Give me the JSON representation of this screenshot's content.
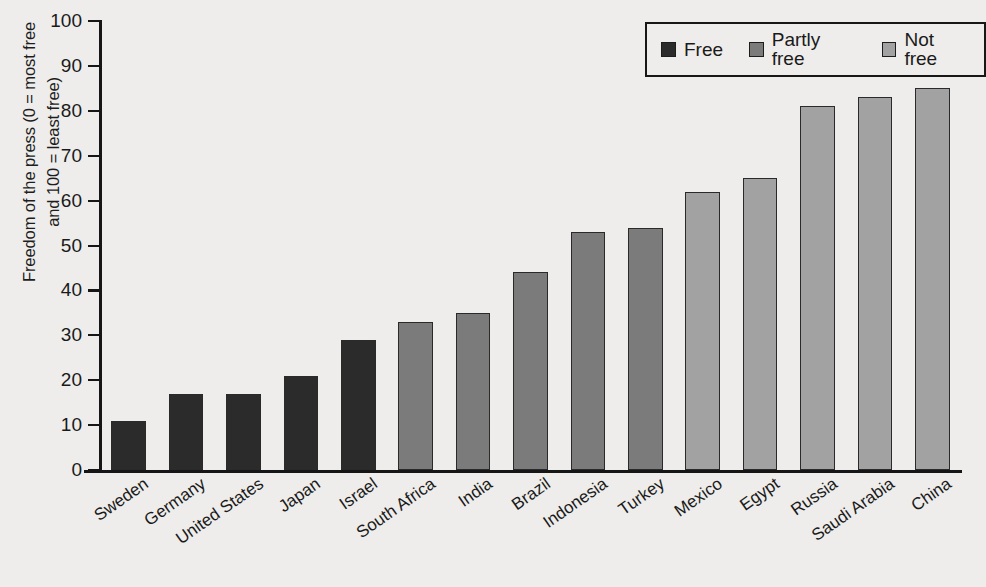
{
  "chart_data": {
    "type": "bar",
    "title": "",
    "subtitle": "",
    "xlabel": "",
    "ylabel": "Freedom of the press (0 = most free\nand 100 = least free)",
    "ylim": [
      0,
      100
    ],
    "ytick_step": 10,
    "yticks": [
      "100",
      "90",
      "80",
      "70",
      "60",
      "50",
      "40",
      "30",
      "20",
      "10",
      "0"
    ],
    "grid": false,
    "legend_position": "top-right",
    "categories": [
      "Sweden",
      "Germany",
      "United States",
      "Japan",
      "Israel",
      "South Africa",
      "India",
      "Brazil",
      "Indonesia",
      "Turkey",
      "Mexico",
      "Egypt",
      "Russia",
      "Saudi Arabia",
      "China"
    ],
    "values": [
      11,
      17,
      17,
      21,
      29,
      33,
      35,
      44,
      53,
      54,
      62,
      65,
      81,
      83,
      85
    ],
    "series": [
      {
        "name": "Freedom of the press score",
        "values": [
          11,
          17,
          17,
          21,
          29,
          33,
          35,
          44,
          53,
          54,
          62,
          65,
          81,
          83,
          85
        ]
      }
    ],
    "categories_status": [
      "Free",
      "Free",
      "Free",
      "Free",
      "Free",
      "Partly free",
      "Partly free",
      "Partly free",
      "Partly free",
      "Partly free",
      "Not free",
      "Not free",
      "Not free",
      "Not free",
      "Not free"
    ],
    "legend": [
      {
        "label": "Free",
        "color": "#2b2b2b"
      },
      {
        "label": "Partly free",
        "color": "#7b7b7b"
      },
      {
        "label": "Not free",
        "color": "#a2a2a2"
      }
    ],
    "colors": {
      "Free": "#2b2b2b",
      "Partly free": "#7b7b7b",
      "Not free": "#a2a2a2",
      "background": "#eeedeb",
      "axis": "#161616",
      "text": "#1a1a1a"
    }
  }
}
